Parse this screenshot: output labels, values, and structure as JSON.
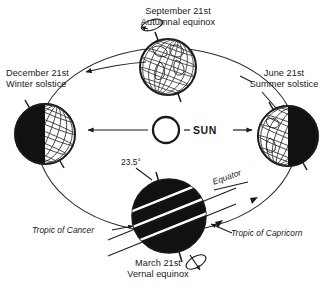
{
  "diagram": {
    "background_color": "#ffffff",
    "ink_color": "#1a1a1a",
    "shadow_color": "#111111"
  },
  "sun": {
    "label": "SUN",
    "center": {
      "x": 166,
      "y": 130
    },
    "radius": 13
  },
  "positions": [
    {
      "id": "september",
      "date": "September 21st",
      "event": "Autumnal equinox",
      "lit": "full",
      "center": {
        "x": 168,
        "y": 67
      },
      "radius": 28
    },
    {
      "id": "december",
      "date": "December 21st",
      "event": "Winter solstice",
      "lit": "right-half",
      "center": {
        "x": 45,
        "y": 134
      },
      "radius": 30
    },
    {
      "id": "june",
      "date": "June 21st",
      "event": "Summer solstice",
      "lit": "left-half",
      "center": {
        "x": 288,
        "y": 136
      },
      "radius": 30
    },
    {
      "id": "march",
      "date": "March 21st",
      "event": "Vernal equinox",
      "lit": "none",
      "center": {
        "x": 169,
        "y": 216
      },
      "radius": 37
    }
  ],
  "annotations": {
    "axial_tilt": "23.5°",
    "equator": "Equator",
    "tropic_of_cancer": "Tropic of Cancer",
    "tropic_of_capricorn": "Tropic of Capricorn"
  },
  "icons": {
    "rotation_arrow": "rotation-arrow-icon",
    "orbit_arrow": "orbit-direction-arrow-icon",
    "sunray_arrow": "sun-ray-arrow-icon",
    "leader_line": "leader-line-icon"
  }
}
